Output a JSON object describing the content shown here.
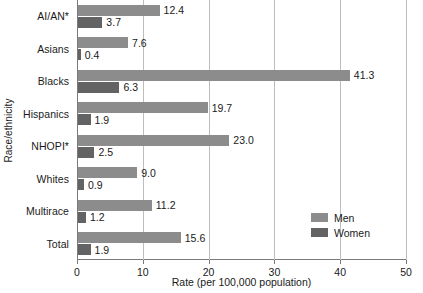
{
  "chart_data": {
    "type": "bar",
    "orientation": "horizontal",
    "title": "",
    "xlabel": "Rate (per 100,000 population)",
    "ylabel": "Race/ethnicity",
    "categories": [
      "AI/AN*",
      "Asians",
      "Blacks",
      "Hispanics",
      "NHOPI*",
      "Whites",
      "Multirace",
      "Total"
    ],
    "series": [
      {
        "name": "Men",
        "color": "#8c8c8c",
        "values": [
          12.4,
          7.6,
          41.3,
          19.7,
          23.0,
          9.0,
          11.2,
          15.6
        ]
      },
      {
        "name": "Women",
        "color": "#636363",
        "values": [
          3.7,
          0.4,
          6.3,
          1.9,
          2.5,
          0.9,
          1.2,
          1.9
        ]
      }
    ],
    "value_labels": {
      "men": [
        "12.4",
        "7.6",
        "41.3",
        "19.7",
        "23.0",
        "9.0",
        "11.2",
        "15.6"
      ],
      "women": [
        "3.7",
        "0.4",
        "6.3",
        "1.9",
        "2.5",
        "0.9",
        "1.2",
        "1.9"
      ]
    },
    "xlim": [
      0,
      50
    ],
    "xticks": [
      0,
      10,
      20,
      30,
      40,
      50
    ],
    "xtick_labels": [
      "0",
      "10",
      "20",
      "30",
      "40",
      "50"
    ],
    "grid": "vertical",
    "legend_position": "inside-right"
  },
  "legend": {
    "entries": [
      {
        "label": "Men",
        "color": "#8c8c8c"
      },
      {
        "label": "Women",
        "color": "#636363"
      }
    ]
  }
}
